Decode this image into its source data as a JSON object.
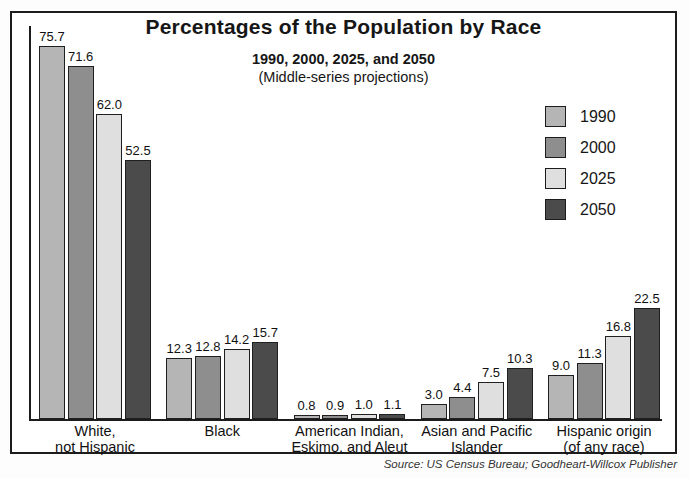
{
  "title": "Percentages of the Population by Race",
  "subtitle": "1990, 2000, 2025, and 2050",
  "subtitle2": "(Middle-series projections)",
  "source": "Source: US Census Bureau; Goodheart-Willcox Publisher",
  "legend": {
    "items": [
      {
        "label": "1990",
        "color": "#b5b5b5"
      },
      {
        "label": "2000",
        "color": "#8e8e8e"
      },
      {
        "label": "2025",
        "color": "#dfdfdf"
      },
      {
        "label": "2050",
        "color": "#4b4b4b"
      }
    ]
  },
  "chart_data": {
    "type": "bar",
    "title": "Percentages of the Population by Race",
    "subtitle": "1990, 2000, 2025, and 2050 (Middle-series projections)",
    "categories": [
      "White,\nnot Hispanic",
      "Black",
      "American Indian,\nEskimo, and Aleut",
      "Asian and Pacific\nIslander",
      "Hispanic origin\n(of any race)"
    ],
    "series": [
      {
        "name": "1990",
        "color": "#b5b5b5",
        "values": [
          75.7,
          12.3,
          0.8,
          3.0,
          9.0
        ]
      },
      {
        "name": "2000",
        "color": "#8e8e8e",
        "values": [
          71.6,
          12.8,
          0.9,
          4.4,
          11.3
        ]
      },
      {
        "name": "2025",
        "color": "#dfdfdf",
        "values": [
          62.0,
          14.2,
          1.0,
          7.5,
          16.8
        ]
      },
      {
        "name": "2050",
        "color": "#4b4b4b",
        "values": [
          52.5,
          15.7,
          1.1,
          10.3,
          22.5
        ]
      }
    ],
    "xlabel": "",
    "ylabel": "",
    "ylim": [
      0,
      80
    ],
    "grid": false,
    "value_labels": true,
    "legend_position": "upper right"
  }
}
